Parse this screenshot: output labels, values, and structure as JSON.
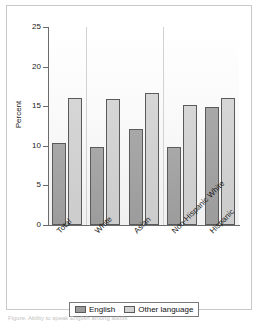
{
  "figure": {
    "caption": "Figure. Ability to speak English among adults"
  },
  "chart_data": {
    "type": "bar",
    "title": "",
    "xlabel": "",
    "ylabel": "Percent",
    "ylim": [
      0,
      25
    ],
    "yticks": [
      0,
      5,
      10,
      15,
      20,
      25
    ],
    "ytick_labels": [
      "0",
      "5",
      "10",
      "15",
      "20",
      "25"
    ],
    "grid": false,
    "legend_position": "bottom",
    "categories": [
      "Total",
      "White",
      "Asian",
      "Non-Hispanic White",
      "Hispanic"
    ],
    "series": [
      {
        "name": "English",
        "color": "#9c9c9c",
        "values": [
          10.3,
          9.9,
          12.1,
          9.9,
          14.9
        ]
      },
      {
        "name": "Other language",
        "color": "#d2d2d2",
        "values": [
          16.1,
          15.9,
          16.7,
          15.2,
          16.1
        ]
      }
    ],
    "group_separators_after": [
      "Total",
      "Asian"
    ]
  },
  "legend": {
    "items": [
      {
        "label": "English",
        "swatch": "english"
      },
      {
        "label": "Other language",
        "swatch": "other"
      }
    ]
  },
  "colors": {
    "english": "#9c9c9c",
    "other": "#d2d2d2",
    "axis": "#6b6b6b",
    "frame": "#c9c9c9"
  }
}
